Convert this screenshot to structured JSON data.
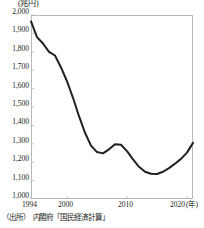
{
  "chart_data": {
    "type": "line",
    "title": "",
    "subtitle": "",
    "unit_label": "(兆円)",
    "xlabel": "(年)",
    "ylabel": "",
    "xlim": [
      1994,
      2021
    ],
    "ylim": [
      1000,
      2000
    ],
    "grid": false,
    "legend": "none",
    "y_ticks": [
      "1,000",
      "1,100",
      "1,200",
      "1,300",
      "1,400",
      "1,500",
      "1,600",
      "1,700",
      "1,800",
      "1,900",
      "2,000"
    ],
    "y_tick_values": [
      1000,
      1100,
      1200,
      1300,
      1400,
      1500,
      1600,
      1700,
      1800,
      1900,
      2000
    ],
    "x_ticks": [
      "1994",
      "2000",
      "2010",
      "2020"
    ],
    "x_tick_values": [
      1994,
      2000,
      2010,
      2020
    ],
    "x_axis_suffix": "(年)",
    "line_color": "#231f20",
    "series": [
      {
        "name": "",
        "x": [
          1994,
          1995,
          1996,
          1997,
          1998,
          1999,
          2000,
          2001,
          2002,
          2003,
          2004,
          2005,
          2006,
          2007,
          2008,
          2009,
          2010,
          2011,
          2012,
          2013,
          2014,
          2015,
          2016,
          2017,
          2018,
          2019,
          2020,
          2021
        ],
        "values": [
          1965,
          1880,
          1845,
          1800,
          1780,
          1715,
          1640,
          1550,
          1450,
          1360,
          1290,
          1255,
          1248,
          1270,
          1298,
          1295,
          1260,
          1215,
          1175,
          1148,
          1137,
          1136,
          1148,
          1168,
          1192,
          1218,
          1252,
          1305
        ]
      }
    ],
    "annotations": []
  },
  "source": {
    "note": "（出所）　内閣府「国民経済計算」"
  }
}
